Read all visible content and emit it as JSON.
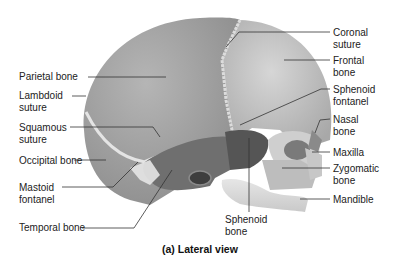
{
  "caption": "(a) Lateral view",
  "labels": {
    "parietal_bone": "Parietal bone",
    "lambdoid_suture_1": "Lambdoid",
    "lambdoid_suture_2": "suture",
    "squamous_suture_1": "Squamous",
    "squamous_suture_2": "suture",
    "occipital_bone": "Occipital bone",
    "mastoid_fontanel_1": "Mastoid",
    "mastoid_fontanel_2": "fontanel",
    "temporal_bone": "Temporal bone",
    "coronal_suture_1": "Coronal",
    "coronal_suture_2": "suture",
    "frontal_bone_1": "Frontal",
    "frontal_bone_2": "bone",
    "sphenoid_fontanel_1": "Sphenoid",
    "sphenoid_fontanel_2": "fontanel",
    "nasal_bone_1": "Nasal",
    "nasal_bone_2": "bone",
    "maxilla": "Maxilla",
    "zygomatic_bone_1": "Zygomatic",
    "zygomatic_bone_2": "bone",
    "mandible": "Mandible",
    "sphenoid_bone_1": "Sphenoid",
    "sphenoid_bone_2": "bone"
  },
  "colors": {
    "parietal": "#a9a9a9",
    "frontal": "#c4c4c4",
    "temporal": "#6e6e6e",
    "sphenoid": "#5a5a5a",
    "suture": "#e8e8e8",
    "leader": "#333333"
  }
}
